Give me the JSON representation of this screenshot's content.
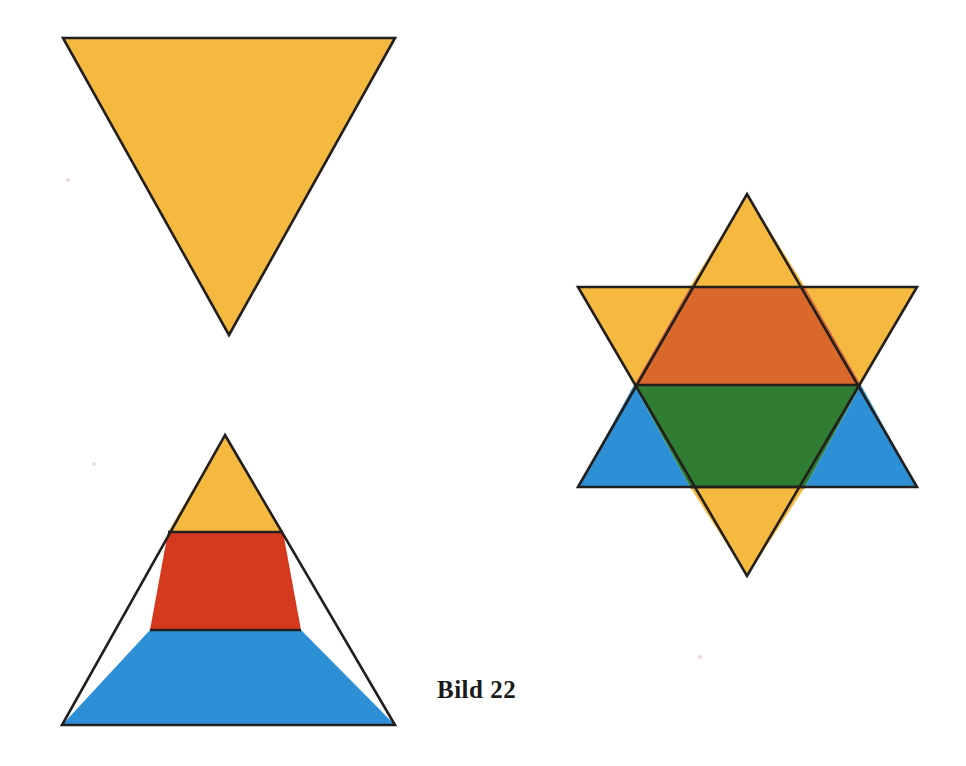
{
  "page": {
    "title": "Bild 22",
    "background_color": "#ffffff",
    "width": 966,
    "height": 766
  },
  "caption": {
    "text": "Bild 22"
  },
  "palette": {
    "amber": "#F5B940",
    "red": "#D63A1E",
    "blue": "#2D8FD5",
    "burnt_orange": "#D9682A",
    "green": "#2E7D32",
    "outline": "#231f1c",
    "background": "#ffffff"
  },
  "figures": [
    {
      "id": "inverted-triangle",
      "name": "Inverted amber triangle",
      "label": "downward-pointing triangle",
      "points": "63,38 395,38 229,335",
      "fill": "#F5B940",
      "stroke": "#231f1c",
      "stroke_width": 2.6
    },
    {
      "id": "banded-triangle",
      "name": "Banded upright triangle",
      "label": "upward-pointing triangle split into three horizontal bands",
      "outline_points": "225,435 395,725 62,725",
      "stroke": "#231f1c",
      "stroke_width": 2.6,
      "bands": [
        {
          "id": "band-top",
          "name": "amber apex band",
          "points": "225,435 283,532 168,532",
          "fill": "#F5B940",
          "color_name": "amber"
        },
        {
          "id": "band-middle",
          "name": "red middle band",
          "points": "168,532 283,532 301,630 150,630",
          "fill": "#D63A1E",
          "color_name": "red"
        },
        {
          "id": "band-bottom",
          "name": "blue base band",
          "points": "150,630 301,630 395,725 62,725",
          "fill": "#2D8FD5",
          "color_name": "blue"
        }
      ],
      "divider_lines": [
        {
          "id": "divider-amber-red",
          "x1": 168,
          "y1": 532,
          "x2": 283,
          "y2": 532
        },
        {
          "id": "divider-red-blue",
          "x1": 150,
          "y1": 630,
          "x2": 301,
          "y2": 630
        }
      ]
    },
    {
      "id": "star-of-david",
      "name": "Superimposed hexagram",
      "label": "six-pointed star formed by overlaying both triangles",
      "stroke": "#231f1c",
      "stroke_width": 2.6,
      "up_triangle_points": "747,194 917,487 578,487",
      "down_triangle_points": "578,287 917,287 747,576",
      "regions": [
        {
          "id": "star-point-top",
          "name": "top point",
          "points": "747,194 805,287 690,287",
          "fill": "#F5B940",
          "color_name": "amber"
        },
        {
          "id": "star-point-upper-left",
          "name": "upper-left point",
          "points": "578,287 690,287 634,385",
          "fill": "#F5B940",
          "color_name": "amber"
        },
        {
          "id": "star-point-upper-right",
          "name": "upper-right point",
          "points": "805,287 917,287 861,385",
          "fill": "#F5B940",
          "color_name": "amber"
        },
        {
          "id": "star-core-upper",
          "name": "upper core trapezoid (amber over red)",
          "points": "690,287 805,287 861,385 634,385",
          "fill": "#D9682A",
          "color_name": "burnt_orange"
        },
        {
          "id": "star-core-lower",
          "name": "lower core trapezoid (amber over blue)",
          "points": "634,385 861,385 805,487 690,487",
          "fill": "#2E7D32",
          "color_name": "green"
        },
        {
          "id": "star-point-lower-left",
          "name": "lower-left point",
          "points": "578,487 634,385 690,487",
          "fill": "#2D8FD5",
          "color_name": "blue"
        },
        {
          "id": "star-point-lower-right",
          "name": "lower-right point",
          "points": "861,385 917,487 805,487",
          "fill": "#2D8FD5",
          "color_name": "blue"
        },
        {
          "id": "star-point-bottom",
          "name": "bottom point",
          "points": "690,487 805,487 747,576",
          "fill": "#F5B940",
          "color_name": "amber"
        }
      ],
      "internal_lines": [
        {
          "id": "star-line-upper-band",
          "x1": 634,
          "y1": 385,
          "x2": 861,
          "y2": 385
        },
        {
          "id": "star-line-lower-band",
          "x1": 690,
          "y1": 487,
          "x2": 805,
          "y2": 487
        }
      ]
    }
  ],
  "specks": [
    {
      "id": "speck-left-upper",
      "x": 66,
      "y": 178,
      "color": "#c98f8f"
    },
    {
      "id": "speck-left-mid",
      "x": 92,
      "y": 462,
      "color": "#b0b0b0"
    },
    {
      "id": "speck-right-lower",
      "x": 698,
      "y": 655,
      "color": "#c98f8f"
    }
  ]
}
